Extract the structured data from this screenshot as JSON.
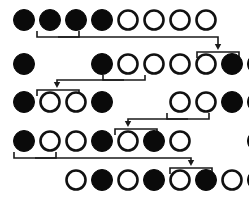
{
  "diagram": {
    "colors": {
      "filled": "#0a0a0a",
      "open_fill": "#ffffff",
      "open_stroke": "#111111",
      "connector": "#1a1a1a",
      "background": "#ffffff"
    },
    "geometry": {
      "col_start_x": 24,
      "col_step": 26,
      "radius": 10.5,
      "open_radius": 9.5
    },
    "rows": [
      {
        "id": "row-1",
        "cy": 20,
        "cells": [
          {
            "col": 1,
            "state": "filled"
          },
          {
            "col": 2,
            "state": "filled"
          },
          {
            "col": 3,
            "state": "filled"
          },
          {
            "col": 4,
            "state": "filled"
          },
          {
            "col": 5,
            "state": "open"
          },
          {
            "col": 6,
            "state": "open"
          },
          {
            "col": 7,
            "state": "open"
          },
          {
            "col": 8,
            "state": "open"
          }
        ]
      },
      {
        "id": "row-2",
        "cy": 64,
        "cells": [
          {
            "col": 1,
            "state": "filled"
          },
          {
            "col": 4,
            "state": "filled"
          },
          {
            "col": 5,
            "state": "open"
          },
          {
            "col": 6,
            "state": "open"
          },
          {
            "col": 7,
            "state": "open"
          },
          {
            "col": 8,
            "state": "open"
          },
          {
            "col": 9,
            "state": "filled"
          },
          {
            "col": 10,
            "state": "filled"
          }
        ]
      },
      {
        "id": "row-3",
        "cy": 102,
        "cells": [
          {
            "col": 1,
            "state": "filled"
          },
          {
            "col": 2,
            "state": "open"
          },
          {
            "col": 3,
            "state": "open"
          },
          {
            "col": 4,
            "state": "filled"
          },
          {
            "col": 7,
            "state": "open"
          },
          {
            "col": 8,
            "state": "open"
          },
          {
            "col": 9,
            "state": "filled"
          },
          {
            "col": 10,
            "state": "filled"
          }
        ]
      },
      {
        "id": "row-4",
        "cy": 141,
        "cells": [
          {
            "col": 1,
            "state": "filled"
          },
          {
            "col": 2,
            "state": "open"
          },
          {
            "col": 3,
            "state": "open"
          },
          {
            "col": 4,
            "state": "filled"
          },
          {
            "col": 5,
            "state": "open"
          },
          {
            "col": 6,
            "state": "filled"
          },
          {
            "col": 7,
            "state": "open"
          },
          {
            "col": 10,
            "state": "filled"
          }
        ]
      },
      {
        "id": "row-5",
        "cy": 180,
        "cells": [
          {
            "col": 3,
            "state": "open"
          },
          {
            "col": 4,
            "state": "filled"
          },
          {
            "col": 5,
            "state": "open"
          },
          {
            "col": 6,
            "state": "filled"
          },
          {
            "col": 7,
            "state": "open"
          },
          {
            "col": 8,
            "state": "filled"
          },
          {
            "col": 9,
            "state": "open"
          },
          {
            "col": 10,
            "state": "filled"
          }
        ]
      }
    ],
    "connectors": [
      {
        "id": "connector-1",
        "source_row": "row-1",
        "source_cols": [
          2,
          3
        ],
        "target_row": "row-2",
        "target_cols": [
          9,
          10
        ],
        "direction": "right",
        "source_bracket": {
          "x1": 37,
          "x2": 79,
          "y_top": 31,
          "y_bar": 37
        },
        "run_x": 218,
        "run_y": 37,
        "arrow_y": 50,
        "target_bracket": {
          "x1": 197,
          "x2": 239,
          "y_bar": 52,
          "y_bottom": 58
        }
      },
      {
        "id": "connector-2",
        "source_row": "row-2",
        "source_cols": [
          5,
          6
        ],
        "target_row": "row-3",
        "target_cols": [
          2,
          3
        ],
        "direction": "left",
        "source_bracket": {
          "x1": 103,
          "x2": 145,
          "y_top": 75,
          "y_bar": 80
        },
        "run_x": 57,
        "run_y": 80,
        "arrow_y": 88,
        "target_bracket": {
          "x1": 37,
          "x2": 79,
          "y_bar": 90,
          "y_bottom": 96
        }
      },
      {
        "id": "connector-3",
        "source_row": "row-3",
        "source_cols": [
          8,
          9
        ],
        "target_row": "row-4",
        "target_cols": [
          5,
          6
        ],
        "direction": "left",
        "source_bracket": {
          "x1": 167,
          "x2": 209,
          "y_top": 113,
          "y_bar": 119
        },
        "run_x": 128,
        "run_y": 119,
        "arrow_y": 127,
        "target_bracket": {
          "x1": 115,
          "x2": 157,
          "y_bar": 129,
          "y_bottom": 135
        }
      },
      {
        "id": "connector-4",
        "source_row": "row-4",
        "source_cols": [
          1,
          2
        ],
        "target_row": "row-5",
        "target_cols": [
          8,
          9
        ],
        "direction": "right",
        "source_bracket": {
          "x1": 14,
          "x2": 56,
          "y_top": 152,
          "y_bar": 158
        },
        "run_x": 191,
        "run_y": 158,
        "arrow_y": 166,
        "target_bracket": {
          "x1": 170,
          "x2": 212,
          "y_bar": 168,
          "y_bottom": 174
        }
      }
    ]
  }
}
